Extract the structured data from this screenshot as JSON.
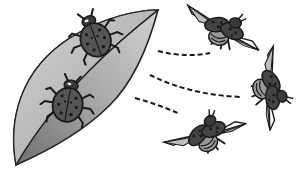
{
  "illustration": {
    "subject": "ladybugs leaving a leaf and flying away",
    "elements": {
      "leaf": {
        "icon": "leaf-icon",
        "fill_light": "#c8c8c8",
        "fill_dark": "#8a8a8a",
        "stroke": "#222222"
      },
      "resting_beetles": [
        {
          "icon": "ladybug-icon",
          "x": 95,
          "y": 38,
          "rotation": -20
        },
        {
          "icon": "ladybug-icon",
          "x": 68,
          "y": 103,
          "rotation": 10
        }
      ],
      "flying_beetles": [
        {
          "icon": "flying-ladybug-icon",
          "x": 222,
          "y": 30,
          "rotation": 15
        },
        {
          "icon": "flying-ladybug-icon",
          "x": 270,
          "y": 88,
          "rotation": 75
        },
        {
          "icon": "flying-ladybug-icon",
          "x": 205,
          "y": 135,
          "rotation": -40
        }
      ],
      "flight_paths": [
        {
          "icon": "dashed-path",
          "from": [
            158,
            51
          ],
          "to": [
            210,
            54
          ]
        },
        {
          "icon": "dashed-path",
          "from": [
            150,
            75
          ],
          "to": [
            240,
            97
          ]
        },
        {
          "icon": "dashed-path",
          "from": [
            135,
            98
          ],
          "to": [
            180,
            115
          ]
        }
      ]
    },
    "colors": {
      "ink": "#1a1a1a",
      "beetle_body": "#4a4a4a",
      "beetle_spots": "#1a1a1a",
      "wing": "#ffffff",
      "wing_tint": "#bbbbbb",
      "abdomen_stripe": "#9a9a9a"
    }
  }
}
